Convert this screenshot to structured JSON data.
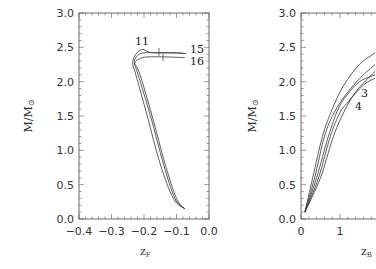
{
  "chart_data": [
    {
      "type": "line",
      "panel": "left",
      "title": "",
      "xlabel": "z_F",
      "ylabel": "M/M_⊙",
      "xlim": [
        -0.4,
        0.0
      ],
      "ylim": [
        0.0,
        3.0
      ],
      "xticks": [
        "-0.4",
        "-0.3",
        "-0.2",
        "-0.1",
        "0.0"
      ],
      "yticks": [
        "0.0",
        "0.5",
        "1.0",
        "1.5",
        "2.0",
        "2.5",
        "3.0"
      ],
      "grid": false,
      "annotations": [
        "11",
        "15",
        "16"
      ],
      "series": [
        {
          "name": "11",
          "points": [
            [
              -0.075,
              0.15
            ],
            [
              -0.11,
              0.3
            ],
            [
              -0.15,
              0.8
            ],
            [
              -0.19,
              1.5
            ],
            [
              -0.225,
              2.1
            ],
            [
              -0.235,
              2.27
            ],
            [
              -0.225,
              2.4
            ],
            [
              -0.205,
              2.47
            ],
            [
              -0.185,
              2.43
            ],
            [
              -0.16,
              2.42
            ],
            [
              -0.12,
              2.42
            ],
            [
              -0.07,
              2.41
            ]
          ]
        },
        {
          "name": "15",
          "points": [
            [
              -0.075,
              0.15
            ],
            [
              -0.105,
              0.3
            ],
            [
              -0.14,
              0.8
            ],
            [
              -0.18,
              1.5
            ],
            [
              -0.218,
              2.1
            ],
            [
              -0.23,
              2.28
            ],
            [
              -0.22,
              2.38
            ],
            [
              -0.2,
              2.42
            ],
            [
              -0.16,
              2.42
            ],
            [
              -0.1,
              2.42
            ],
            [
              -0.075,
              2.41
            ]
          ]
        },
        {
          "name": "16",
          "points": [
            [
              -0.075,
              0.15
            ],
            [
              -0.1,
              0.3
            ],
            [
              -0.135,
              0.8
            ],
            [
              -0.175,
              1.5
            ],
            [
              -0.212,
              2.1
            ],
            [
              -0.228,
              2.27
            ],
            [
              -0.215,
              2.33
            ],
            [
              -0.19,
              2.36
            ],
            [
              -0.13,
              2.36
            ],
            [
              -0.075,
              2.35
            ]
          ]
        }
      ]
    },
    {
      "type": "line",
      "panel": "right",
      "title": "",
      "xlabel": "z_B",
      "ylabel": "M/M_⊙",
      "xlim": [
        0,
        2
      ],
      "ylim": [
        0.0,
        3.0
      ],
      "xticks": [
        "0",
        "1"
      ],
      "yticks": [
        "0.0",
        "0.5",
        "1.0",
        "1.5",
        "2.0",
        "2.5",
        "3.0"
      ],
      "grid": false,
      "annotations": [
        "3",
        "4"
      ],
      "series": [
        {
          "name": "a",
          "points": [
            [
              0.1,
              0.1
            ],
            [
              0.3,
              0.6
            ],
            [
              0.55,
              1.2
            ],
            [
              0.8,
              1.6
            ],
            [
              1.1,
              1.95
            ],
            [
              1.5,
              2.25
            ],
            [
              1.9,
              2.42
            ]
          ]
        },
        {
          "name": "b",
          "points": [
            [
              0.1,
              0.1
            ],
            [
              0.35,
              0.6
            ],
            [
              0.6,
              1.2
            ],
            [
              0.85,
              1.55
            ],
            [
              1.2,
              1.85
            ],
            [
              1.6,
              2.1
            ],
            [
              1.9,
              2.25
            ]
          ]
        },
        {
          "name": "3",
          "points": [
            [
              0.1,
              0.1
            ],
            [
              0.4,
              0.6
            ],
            [
              0.7,
              1.2
            ],
            [
              0.95,
              1.6
            ],
            [
              1.2,
              1.82
            ],
            [
              1.5,
              2.0
            ],
            [
              1.9,
              2.1
            ]
          ]
        },
        {
          "name": "4",
          "points": [
            [
              0.1,
              0.1
            ],
            [
              0.45,
              0.6
            ],
            [
              0.75,
              1.2
            ],
            [
              1.0,
              1.55
            ],
            [
              1.2,
              1.7
            ],
            [
              1.6,
              1.95
            ],
            [
              1.9,
              2.05
            ]
          ]
        },
        {
          "name": "e",
          "points": [
            [
              0.1,
              0.1
            ],
            [
              0.5,
              0.6
            ],
            [
              0.8,
              1.15
            ],
            [
              1.05,
              1.5
            ],
            [
              1.4,
              1.85
            ],
            [
              1.9,
              2.15
            ]
          ]
        }
      ]
    }
  ],
  "left": {
    "ylabel_main": "M/M",
    "ylabel_sub": "⊙",
    "xlabel_main": "z",
    "xlabel_sub": "F",
    "yticks": [
      "0.0",
      "0.5",
      "1.0",
      "1.5",
      "2.0",
      "2.5",
      "3.0"
    ],
    "xticks": [
      "−0.4",
      "−0.3",
      "−0.2",
      "−0.1",
      "0.0"
    ],
    "labels": {
      "c11": "11",
      "c15": "15",
      "c16": "16"
    }
  },
  "right": {
    "ylabel_main": "M/M",
    "ylabel_sub": "⊙",
    "xlabel_main": "z",
    "xlabel_sub": "B",
    "yticks": [
      "0.0",
      "0.5",
      "1.0",
      "1.5",
      "2.0",
      "2.5",
      "3.0"
    ],
    "xticks": [
      "0",
      "1"
    ],
    "labels": {
      "c3": "3",
      "c4": "4"
    }
  }
}
